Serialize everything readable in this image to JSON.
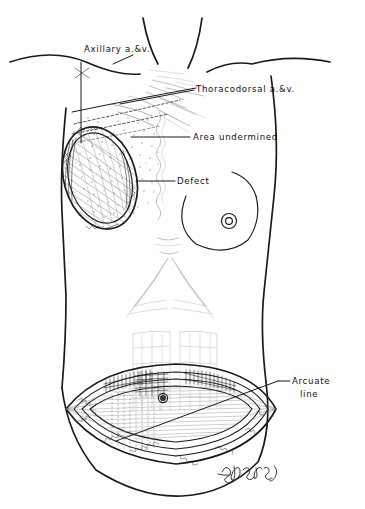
{
  "figure": {
    "medium": "pen-and-ink medical illustration",
    "background_color": "#ffffff",
    "ink_color": "#1a1a1a",
    "view": "anterior torso, female, head and limbs cropped"
  },
  "labels": [
    {
      "id": "axillary",
      "text": "Axillary a.&v.",
      "x": 84,
      "y": 52,
      "anchor": "start",
      "size": "big",
      "leader": "M 133 55 L 113 64",
      "pointer": "M 81 62 L 81 143",
      "marker": "x-cross"
    },
    {
      "id": "thoracodorsal",
      "text": "Thoracodorsal a.&v.",
      "x": 196,
      "y": 92,
      "anchor": "start",
      "size": "big",
      "leader": "M 194 90 L 120 104",
      "pointer": "",
      "marker": "none"
    },
    {
      "id": "area-undermined",
      "text": "Area undermined",
      "x": 193,
      "y": 140,
      "anchor": "start",
      "size": "big",
      "leader": "M 190 137 L 131 137",
      "pointer": "",
      "marker": "none"
    },
    {
      "id": "defect",
      "text": "Defect",
      "x": 177,
      "y": 184,
      "anchor": "start",
      "size": "big",
      "leader": "M 175 181 L 136 181",
      "pointer": "",
      "marker": "none"
    },
    {
      "id": "arcuate-line",
      "text": "Arcuate",
      "text2": "line",
      "x": 292,
      "y": 384,
      "x2": 300,
      "y2": 397,
      "anchor": "start",
      "size": "big",
      "leader": "M 290 381 L 278 381",
      "pointer": "M 278 381 L 116 441",
      "marker": "none"
    }
  ],
  "annotations": {
    "umbilicus": "umbilicus",
    "nipple": "nipple-areola complex",
    "signature": "artist signature (cursive, illegible)"
  }
}
